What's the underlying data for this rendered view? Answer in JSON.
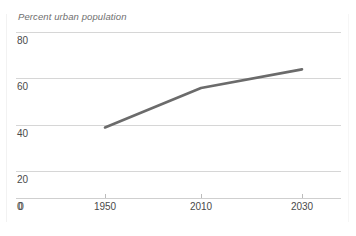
{
  "chart_data": {
    "type": "line",
    "title": "Percent urban population",
    "xlabel": "",
    "ylabel": "",
    "x": [
      1950,
      2010,
      2030
    ],
    "values": [
      34,
      53,
      62
    ],
    "series": [
      {
        "name": "Percent urban population",
        "x": [
          1950,
          2010,
          2030
        ],
        "values": [
          34,
          53,
          62
        ]
      }
    ],
    "x_tick_labels": [
      "0",
      "1950",
      "2010",
      "2030"
    ],
    "y_tick_labels": [
      "0",
      "20",
      "40",
      "60",
      "80"
    ],
    "yticks": [
      0,
      20,
      40,
      60,
      80
    ],
    "ylim": [
      0,
      80
    ],
    "grid": true,
    "legend": false,
    "legend_position": "none",
    "line_color": "#6b6b6b",
    "gridline_color": "#d6d6d6",
    "text_color": "#4a4a4a",
    "background_color": "#ffffff"
  },
  "axes": {
    "y_labels": [
      {
        "text": "80"
      },
      {
        "text": "60"
      },
      {
        "text": "40"
      },
      {
        "text": "20"
      },
      {
        "text": "0"
      }
    ],
    "x_labels": [
      {
        "text": "0"
      },
      {
        "text": "1950"
      },
      {
        "text": "2010"
      },
      {
        "text": "2030"
      }
    ]
  }
}
